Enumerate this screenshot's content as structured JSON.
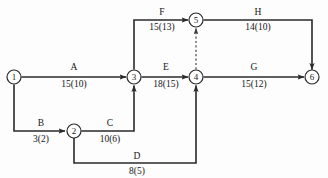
{
  "diagram": {
    "stroke_color": "#2a2a2a",
    "background_color": "#fdfdfd",
    "width": 328,
    "height": 178
  },
  "nodes": [
    {
      "id": "1",
      "label": "1",
      "x": 14,
      "y": 77,
      "r": 7
    },
    {
      "id": "2",
      "label": "2",
      "x": 74,
      "y": 131,
      "r": 7
    },
    {
      "id": "3",
      "label": "3",
      "x": 134,
      "y": 77,
      "r": 7
    },
    {
      "id": "4",
      "label": "4",
      "x": 196,
      "y": 77,
      "r": 7
    },
    {
      "id": "5",
      "label": "5",
      "x": 196,
      "y": 20,
      "r": 7
    },
    {
      "id": "6",
      "label": "6",
      "x": 312,
      "y": 77,
      "r": 7
    }
  ],
  "edges": [
    {
      "id": "A",
      "name": "A",
      "duration": "15(10)",
      "from": "1",
      "to": "3",
      "path": "M 21.5 77 L 126 77",
      "dashed": false,
      "name_x": 74,
      "name_y": 70,
      "dur_x": 74,
      "dur_y": 87
    },
    {
      "id": "B",
      "name": "B",
      "duration": "3(2)",
      "from": "1",
      "to": "2",
      "path": "M 14 84.5 L 14 131 L 65 131",
      "dashed": false,
      "name_x": 41,
      "name_y": 126,
      "dur_x": 41,
      "dur_y": 142
    },
    {
      "id": "C",
      "name": "C",
      "duration": "10(6)",
      "from": "2",
      "to": "3",
      "path": "M 81.5 131 L 134 131 L 134 85.5",
      "dashed": false,
      "name_x": 110,
      "name_y": 126,
      "dur_x": 110,
      "dur_y": 142
    },
    {
      "id": "D",
      "name": "D",
      "duration": "8(5)",
      "from": "2",
      "to": "4",
      "path": "M 74 138 L 74 163 L 196 163 L 196 85.5",
      "dashed": false,
      "name_x": 137,
      "name_y": 159,
      "dur_x": 137,
      "dur_y": 174
    },
    {
      "id": "E",
      "name": "E",
      "duration": "18(15)",
      "from": "3",
      "to": "4",
      "path": "M 141.5 77 L 188 77",
      "dashed": false,
      "name_x": 166,
      "name_y": 70,
      "dur_x": 166,
      "dur_y": 87
    },
    {
      "id": "F",
      "name": "F",
      "duration": "15(13)",
      "from": "3",
      "to": "5",
      "path": "M 134 69.5 L 134 20 L 188 20",
      "dashed": false,
      "name_x": 162,
      "name_y": 15,
      "dur_x": 162,
      "dur_y": 30
    },
    {
      "id": "G",
      "name": "G",
      "duration": "15(12)",
      "from": "4",
      "to": "6",
      "path": "M 203.5 77 L 304 77",
      "dashed": false,
      "name_x": 254,
      "name_y": 70,
      "dur_x": 254,
      "dur_y": 87
    },
    {
      "id": "H",
      "name": "H",
      "duration": "14(10)",
      "from": "5",
      "to": "6",
      "path": "M 203.5 20 L 312 20 L 312 69.5",
      "dashed": false,
      "name_x": 258,
      "name_y": 15,
      "dur_x": 258,
      "dur_y": 30
    }
  ],
  "dummy_edges": [
    {
      "id": "dummy-4-5",
      "name": "",
      "duration": "",
      "from": "4",
      "to": "5",
      "path": "M 196 69.5 L 196 28.5",
      "dashed": true
    }
  ]
}
